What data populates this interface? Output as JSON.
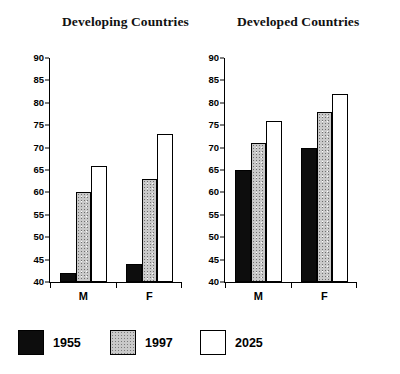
{
  "chart_data": [
    {
      "type": "bar",
      "title": "Developing Countries",
      "categories": [
        "M",
        "F"
      ],
      "series": [
        {
          "name": "1955",
          "values": [
            42,
            44
          ]
        },
        {
          "name": "1997",
          "values": [
            60,
            63
          ]
        },
        {
          "name": "2025",
          "values": [
            66,
            73
          ]
        }
      ],
      "xlabel": "",
      "ylabel": "",
      "ylim": [
        40,
        90
      ],
      "ytick_step": 5,
      "yticks": [
        40,
        45,
        50,
        55,
        60,
        65,
        70,
        75,
        80,
        85,
        90
      ],
      "grid": false
    },
    {
      "type": "bar",
      "title": "Developed Countries",
      "categories": [
        "M",
        "F"
      ],
      "series": [
        {
          "name": "1955",
          "values": [
            65,
            70
          ]
        },
        {
          "name": "1997",
          "values": [
            71,
            78
          ]
        },
        {
          "name": "2025",
          "values": [
            76,
            82
          ]
        }
      ],
      "xlabel": "",
      "ylabel": "",
      "ylim": [
        40,
        90
      ],
      "ytick_step": 5,
      "yticks": [
        40,
        45,
        50,
        55,
        60,
        65,
        70,
        75,
        80,
        85,
        90
      ],
      "grid": false
    }
  ],
  "legend": {
    "position": "bottom",
    "entries": [
      {
        "label": "1955",
        "swatch": "solid-black",
        "color": "#0d0d0d"
      },
      {
        "label": "1997",
        "swatch": "stipple-gray",
        "color": "#c9c9c9"
      },
      {
        "label": "2025",
        "swatch": "outline-white",
        "color": "#ffffff"
      }
    ]
  }
}
